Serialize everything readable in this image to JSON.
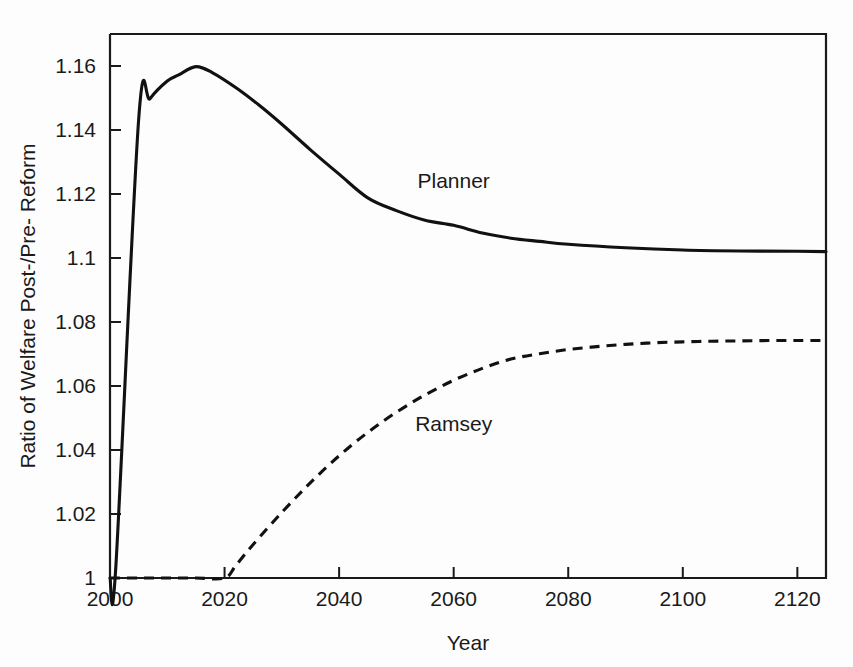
{
  "chart_data": {
    "type": "line",
    "title": "",
    "xlabel": "Year",
    "ylabel": "Ratio of Welfare Post-/Pre- Reform",
    "xlim": [
      2000,
      2125
    ],
    "ylim": [
      1,
      1.17
    ],
    "grid": false,
    "legend_position": "inline-annotations",
    "xticks": [
      2000,
      2020,
      2040,
      2060,
      2080,
      2100,
      2120
    ],
    "xtick_labels": [
      "2000",
      "2020",
      "2040",
      "2060",
      "2080",
      "2100",
      "2120"
    ],
    "yticks": [
      1,
      1.02,
      1.04,
      1.06,
      1.08,
      1.1,
      1.12,
      1.14,
      1.16
    ],
    "ytick_labels": [
      "1",
      "1.02",
      "1.04",
      "1.06",
      "1.08",
      "1.1",
      "1.12",
      "1.14",
      "1.16"
    ],
    "annotations": [
      {
        "text": "Planner",
        "x": 2060,
        "y": 1.122
      },
      {
        "text": "Ramsey",
        "x": 2060,
        "y": 1.046
      }
    ],
    "series": [
      {
        "name": "Planner",
        "style": "solid",
        "x": [
          2000,
          2001,
          2005,
          2007,
          2010,
          2012,
          2015,
          2018,
          2022,
          2026,
          2030,
          2035,
          2040,
          2045,
          2050,
          2055,
          2060,
          2065,
          2070,
          2075,
          2080,
          2090,
          2100,
          2110,
          2120,
          2125
        ],
        "values": [
          1.0,
          1.003,
          1.1432,
          1.1498,
          1.1553,
          1.1572,
          1.1598,
          1.1578,
          1.1532,
          1.1478,
          1.1418,
          1.1338,
          1.1262,
          1.1188,
          1.1148,
          1.1118,
          1.1102,
          1.1078,
          1.1062,
          1.1052,
          1.1043,
          1.1032,
          1.1025,
          1.1022,
          1.1021,
          1.102
        ]
      },
      {
        "name": "Ramsey",
        "style": "dashed",
        "x": [
          2000,
          2005,
          2010,
          2015,
          2020,
          2022,
          2025,
          2030,
          2035,
          2040,
          2045,
          2050,
          2055,
          2060,
          2065,
          2070,
          2075,
          2080,
          2085,
          2090,
          2095,
          2100,
          2105,
          2110,
          2115,
          2120,
          2125
        ],
        "values": [
          1.0,
          1.0,
          1.0,
          1.0,
          1.0,
          1.004,
          1.0105,
          1.0205,
          1.0298,
          1.0382,
          1.0455,
          1.0518,
          1.0572,
          1.0618,
          1.0655,
          1.0684,
          1.0701,
          1.0714,
          1.0723,
          1.073,
          1.0735,
          1.0738,
          1.074,
          1.0741,
          1.0742,
          1.0742,
          1.0742
        ]
      }
    ]
  },
  "axes": {
    "x_title": "Year",
    "y_title": "Ratio of Welfare Post-/Pre- Reform"
  },
  "colors": {
    "line": "#111111",
    "axis": "#1a1a1a",
    "background": "#fdfdfd"
  }
}
